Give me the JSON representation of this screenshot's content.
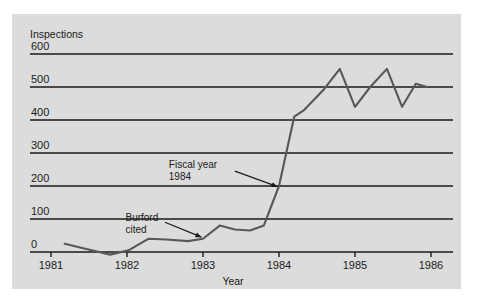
{
  "figure": {
    "panel_color": "#dcdcdc",
    "background_color": "#ffffff",
    "line_color": "#585858",
    "axis_color": "#1a1a1a",
    "text_color": "#1a1a1a"
  },
  "chart_data": {
    "type": "line",
    "title": "",
    "ylabel": "Inspections",
    "xlabel": "Year",
    "ylim": [
      0,
      600
    ],
    "xlim": [
      1981,
      1986
    ],
    "grid": true,
    "grid_axis": "y",
    "legend": false,
    "ytick_labels": [
      "0",
      "100",
      "200",
      "300",
      "400",
      "500",
      "600"
    ],
    "ytick_values": [
      0,
      100,
      200,
      300,
      400,
      500,
      600
    ],
    "xtick_labels": [
      "1981",
      "1982",
      "1983",
      "1984",
      "1985",
      "1986"
    ],
    "xtick_values": [
      1981,
      1982,
      1983,
      1984,
      1985,
      1986
    ],
    "series": [
      {
        "name": "Inspections",
        "x": [
          1981.18,
          1981.45,
          1981.78,
          1982.02,
          1982.28,
          1982.52,
          1982.8,
          1983.0,
          1983.22,
          1983.42,
          1983.62,
          1983.8,
          1984.0,
          1984.2,
          1984.33,
          1984.58,
          1984.8,
          1985.0,
          1985.2,
          1985.42,
          1985.62,
          1985.8,
          1985.95
        ],
        "y": [
          25,
          10,
          -8,
          5,
          40,
          38,
          33,
          40,
          80,
          68,
          65,
          80,
          200,
          410,
          430,
          490,
          555,
          440,
          500,
          555,
          440,
          510,
          500
        ]
      }
    ],
    "annotations": [
      {
        "name": "fiscal-year-1984",
        "lines": [
          "Fiscal year",
          "1984"
        ],
        "text_x": 1982.55,
        "text_y": 255,
        "arrow_from_x": 1983.42,
        "arrow_from_y": 245,
        "arrow_to_x": 1983.98,
        "arrow_to_y": 198
      },
      {
        "name": "burford-cited",
        "lines": [
          "Burford",
          "cited"
        ],
        "text_x": 1981.98,
        "text_y": 95,
        "arrow_from_x": 1982.5,
        "arrow_from_y": 90,
        "arrow_to_x": 1982.98,
        "arrow_to_y": 45
      }
    ]
  }
}
